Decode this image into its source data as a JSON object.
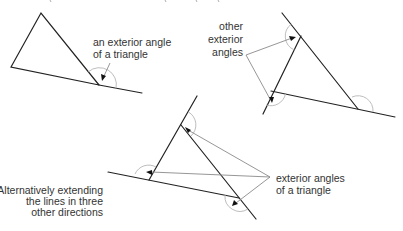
{
  "diagram": {
    "colors": {
      "edge": "#222222",
      "pointer": "#8a8a8a",
      "arc": "#b5b5b5",
      "text": "#333333",
      "background": "#ffffff"
    },
    "panels": [
      {
        "id": "single-exterior-angle",
        "caption_lines": [
          "an exterior angle",
          "of a triangle"
        ]
      },
      {
        "id": "other-exterior-angles",
        "caption_lines": [
          "other",
          "exterior",
          "angles"
        ]
      },
      {
        "id": "alternative-extension",
        "caption_lines": [
          "exterior angles",
          "of a triangle"
        ],
        "side_note_lines": [
          "Alternatively extending",
          "the lines in three",
          "other directions"
        ]
      }
    ]
  }
}
